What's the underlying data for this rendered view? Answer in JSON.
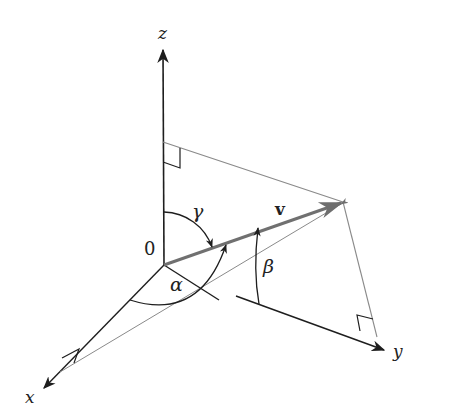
{
  "diagram": {
    "labels": {
      "z_axis": "z",
      "y_axis": "y",
      "x_axis": "x",
      "origin": "0",
      "vector": "v",
      "alpha": "α",
      "beta": "β",
      "gamma": "γ"
    },
    "colors": {
      "axis": "#1e1e1e",
      "vector": "#707070",
      "projection": "#8a8a8a",
      "background": "#ffffff"
    },
    "points": {
      "origin": [
        164,
        265
      ],
      "z_tip": [
        163,
        48
      ],
      "y_tip": [
        386,
        351
      ],
      "x_tip": [
        42,
        390
      ],
      "v_tip": [
        343,
        202
      ]
    }
  }
}
